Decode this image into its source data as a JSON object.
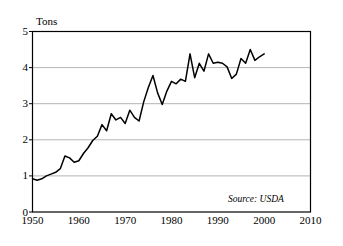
{
  "chart_data": {
    "type": "line",
    "title": "",
    "subtitle": "",
    "xlabel": "",
    "ylabel": "Tons",
    "xlim": [
      1950,
      2010
    ],
    "ylim": [
      0,
      5
    ],
    "grid": "horizontal",
    "legend": "none",
    "annotations": [
      {
        "name": "source-note",
        "text": "Source: USDA"
      }
    ],
    "xticks": [
      1950,
      1960,
      1970,
      1980,
      1990,
      2000,
      2010
    ],
    "xtick_labels": [
      "1950",
      "1960",
      "1970",
      "1980",
      "1990",
      "2000",
      "2010"
    ],
    "yticks": [
      0,
      1,
      2,
      3,
      4,
      5
    ],
    "ytick_labels": [
      "0",
      "1",
      "2",
      "3",
      "4",
      "5"
    ],
    "series": [
      {
        "name": "Tons",
        "color": "#000000",
        "x": [
          1950,
          1951,
          1952,
          1953,
          1954,
          1955,
          1956,
          1957,
          1958,
          1959,
          1960,
          1961,
          1962,
          1963,
          1964,
          1965,
          1966,
          1967,
          1968,
          1969,
          1970,
          1971,
          1972,
          1973,
          1974,
          1975,
          1976,
          1977,
          1978,
          1979,
          1980,
          1981,
          1982,
          1983,
          1984,
          1985,
          1986,
          1987,
          1988,
          1989,
          1990,
          1991,
          1992,
          1993,
          1994,
          1995,
          1996,
          1997,
          1998,
          1999,
          2000
        ],
        "values": [
          0.92,
          0.88,
          0.92,
          1.0,
          1.05,
          1.1,
          1.2,
          1.55,
          1.5,
          1.38,
          1.42,
          1.62,
          1.78,
          1.98,
          2.1,
          2.42,
          2.25,
          2.72,
          2.55,
          2.62,
          2.45,
          2.82,
          2.62,
          2.52,
          3.05,
          3.45,
          3.78,
          3.3,
          2.98,
          3.35,
          3.62,
          3.55,
          3.68,
          3.62,
          4.38,
          3.72,
          4.12,
          3.9,
          4.38,
          4.12,
          4.15,
          4.12,
          4.02,
          3.98,
          4.12,
          4.1,
          3.9,
          4.05,
          4.08,
          3.7,
          3.82
        ]
      }
    ],
    "series_extra": {
      "note": "values continue to 2000 endpoint",
      "tail_x": [
        1993,
        1994,
        1995,
        1996,
        1997,
        1998,
        1999,
        2000
      ],
      "tail_values": [
        3.7,
        3.82,
        4.25,
        4.12,
        4.5,
        4.2,
        4.3,
        4.38
      ]
    }
  },
  "figure": {
    "background_color": "#ffffff",
    "frame_color": "#000000",
    "gridline_color": "#b4b4b4",
    "line_color": "#000000"
  }
}
